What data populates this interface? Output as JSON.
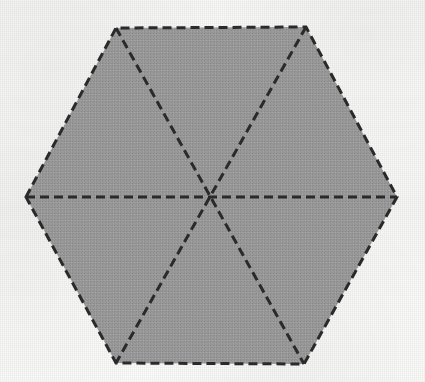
{
  "figure": {
    "name": "regular-hexagon-divided-into-six-triangles",
    "shape": "hexagon",
    "background_color": "#fcfcfa",
    "fill_color": "#9c9c9c",
    "stroke_color": "#2b2b2b",
    "stroke_width": 3,
    "stroke_style": "dashed",
    "dash_pattern": "9 5",
    "canvas": {
      "width": 425,
      "height": 382
    },
    "center": {
      "x": 212,
      "y": 198
    },
    "vertices": [
      {
        "label": "left",
        "x": 26,
        "y": 197
      },
      {
        "label": "top-left",
        "x": 116,
        "y": 28
      },
      {
        "label": "top-right",
        "x": 306,
        "y": 27
      },
      {
        "label": "right",
        "x": 397,
        "y": 197
      },
      {
        "label": "bottom-right",
        "x": 304,
        "y": 364
      },
      {
        "label": "bottom-left",
        "x": 116,
        "y": 363
      }
    ],
    "diagonals": [
      {
        "label": "horizontal-diameter",
        "from": "left",
        "to": "right"
      },
      {
        "label": "top-left-to-bottom-right-diameter",
        "from": "top-left",
        "to": "bottom-right"
      },
      {
        "label": "top-right-to-bottom-left-diameter",
        "from": "top-right",
        "to": "bottom-left"
      }
    ],
    "region_count": 6,
    "region_label": "equilateral-triangle"
  }
}
